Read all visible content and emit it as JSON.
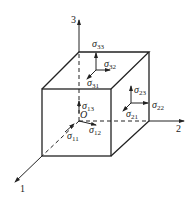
{
  "diagram": {
    "axes": [
      {
        "id": "axis-1",
        "label": "1"
      },
      {
        "id": "axis-2",
        "label": "2"
      },
      {
        "id": "axis-3",
        "label": "3"
      }
    ],
    "origin_label": "O",
    "stresses": [
      {
        "id": "s11",
        "symbol": "σ",
        "sub": "11",
        "face": "front"
      },
      {
        "id": "s12",
        "symbol": "σ",
        "sub": "12",
        "face": "front"
      },
      {
        "id": "s13",
        "symbol": "σ",
        "sub": "13",
        "face": "front"
      },
      {
        "id": "s21",
        "symbol": "σ",
        "sub": "21",
        "face": "right"
      },
      {
        "id": "s22",
        "symbol": "σ",
        "sub": "22",
        "face": "right"
      },
      {
        "id": "s23",
        "symbol": "σ",
        "sub": "23",
        "face": "right"
      },
      {
        "id": "s31",
        "symbol": "σ",
        "sub": "31",
        "face": "top"
      },
      {
        "id": "s32",
        "symbol": "σ",
        "sub": "32",
        "face": "top"
      },
      {
        "id": "s33",
        "symbol": "σ",
        "sub": "33",
        "face": "top"
      }
    ],
    "colors": {
      "line": "#222222",
      "background": "#ffffff"
    }
  }
}
